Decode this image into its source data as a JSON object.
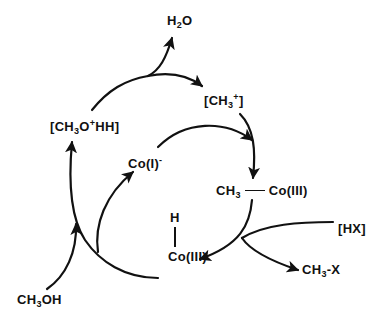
{
  "diagram": {
    "type": "catalytic-cycle",
    "colors": {
      "background": "#ffffff",
      "ink": "#111111"
    },
    "species": {
      "water": {
        "base": "H",
        "sub": "2",
        "tail": "O"
      },
      "methyl_cation": {
        "open": "[CH",
        "sub": "3",
        "sup": "+",
        "close": "]"
      },
      "protonated_methanol": {
        "open": "[CH",
        "sub": "3",
        "mid": "O",
        "sup": "+",
        "close": "HH]"
      },
      "cobalt_one": {
        "base": "Co(I)",
        "sup": "-"
      },
      "methyl_cobalt": {
        "left": "CH",
        "sub": "3",
        "right": "Co(III)"
      },
      "hx": {
        "text": "[HX]"
      },
      "hydrido_cobalt": {
        "top": "H",
        "bottom": "Co(III)"
      },
      "methyl_x": {
        "base": "CH",
        "sub": "3",
        "tail": "-X"
      },
      "methanol": {
        "base": "CH",
        "sub": "3",
        "tail": "OH"
      }
    },
    "edges": [
      {
        "from": "CH3OH",
        "to": "[CH3O+HH]"
      },
      {
        "from": "H-Co(III)",
        "to": "[CH3O+HH]"
      },
      {
        "from": "H-Co(III)",
        "to": "Co(I)-"
      },
      {
        "from": "[CH3O+HH]",
        "to": "H2O"
      },
      {
        "from": "[CH3O+HH]",
        "to": "[CH3+]"
      },
      {
        "from": "[CH3+]",
        "to": "CH3-Co(III)"
      },
      {
        "from": "Co(I)-",
        "to": "CH3-Co(III)"
      },
      {
        "from": "CH3-Co(III)",
        "to": "H-Co(III)"
      },
      {
        "from": "[HX]",
        "to": "CH3-X"
      }
    ]
  }
}
